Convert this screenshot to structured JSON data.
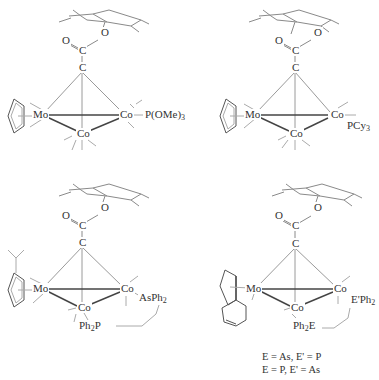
{
  "figure": {
    "type": "organometallic cluster structures",
    "structures": [
      {
        "id": "1",
        "atoms": {
          "ester_O": "O",
          "carbonyl_O": "O",
          "carbonyl_C": "C",
          "alkyne_C": "C",
          "metal_Mo": "Mo",
          "metal_Co_right": "Co",
          "metal_Co_bottom": "Co"
        },
        "ligand": "P(OMe)",
        "ligand_sub": "3"
      },
      {
        "id": "2",
        "atoms": {
          "ester_O": "O",
          "carbonyl_O": "O",
          "carbonyl_C": "C",
          "alkyne_C": "C",
          "metal_Mo": "Mo",
          "metal_Co_right": "Co",
          "metal_Co_bottom": "Co"
        },
        "ligand": "PCy",
        "ligand_sub": "3"
      },
      {
        "id": "3",
        "atoms": {
          "ester_O": "O",
          "carbonyl_O": "O",
          "carbonyl_C": "C",
          "alkyne_C": "C",
          "metal_Mo": "Mo",
          "metal_Co_right": "Co",
          "metal_Co_bottom": "Co"
        },
        "ligand_right": "AsPh",
        "ligand_right_sub": "2",
        "ligand_bottom_pre": "Ph",
        "ligand_bottom_sub": "2",
        "ligand_bottom_post": "P"
      },
      {
        "id": "4",
        "atoms": {
          "ester_O": "O",
          "carbonyl_O": "O",
          "carbonyl_C": "C",
          "alkyne_C": "C",
          "metal_Mo": "Mo",
          "metal_Co_right": "Co",
          "metal_Co_bottom": "Co"
        },
        "ligand_right": "E'Ph",
        "ligand_right_sub": "2",
        "ligand_bottom_pre": "Ph",
        "ligand_bottom_sub": "2",
        "ligand_bottom_post": "E"
      }
    ],
    "caption": {
      "line1": "E = As, E' = P",
      "line2": "E = P, E' = As"
    }
  }
}
